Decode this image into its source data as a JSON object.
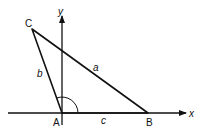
{
  "diagram": {
    "type": "triangle-on-axes",
    "axes": {
      "x_label": "x",
      "y_label": "y"
    },
    "vertices": {
      "A": "A",
      "B": "B",
      "C": "C"
    },
    "sides": {
      "a": "a",
      "b": "b",
      "c": "c"
    },
    "angle_marker_at": "A",
    "colors": {
      "stroke": "#111111",
      "background": "#ffffff"
    }
  }
}
